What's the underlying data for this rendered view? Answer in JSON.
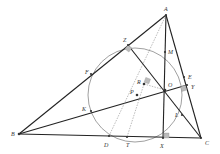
{
  "diagram": {
    "type": "geometry-triangle-with-circle",
    "points": {
      "A": {
        "label": "A",
        "x": 166,
        "y": 15
      },
      "B": {
        "label": "B",
        "x": 19,
        "y": 134
      },
      "C": {
        "label": "C",
        "x": 201,
        "y": 138
      },
      "Z": {
        "label": "Z",
        "x": 128,
        "y": 45
      },
      "F": {
        "label": "F",
        "x": 91,
        "y": 74
      },
      "K": {
        "label": "K",
        "x": 91,
        "y": 111
      },
      "M": {
        "label": "M",
        "x": 165,
        "y": 52
      },
      "E": {
        "label": "E",
        "x": 184,
        "y": 77
      },
      "Y": {
        "label": "Y",
        "x": 187,
        "y": 85
      },
      "O": {
        "label": "O",
        "x": 165,
        "y": 90
      },
      "R": {
        "label": "R",
        "x": 144,
        "y": 84
      },
      "P": {
        "label": "P",
        "x": 137,
        "y": 95
      },
      "L": {
        "label": "L",
        "x": 182,
        "y": 115
      },
      "D": {
        "label": "D",
        "x": 109,
        "y": 136
      },
      "T": {
        "label": "T",
        "x": 127,
        "y": 137
      },
      "X": {
        "label": "X",
        "x": 163,
        "y": 138
      }
    },
    "circle": {
      "cx": 135,
      "cy": 95,
      "r": 47
    },
    "right_angle_markers": [
      "Z",
      "R",
      "Y",
      "X"
    ]
  }
}
